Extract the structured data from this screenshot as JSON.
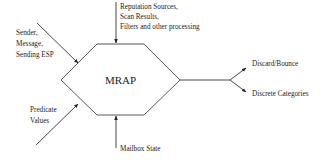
{
  "diagram": {
    "center": {
      "label": "MRAP",
      "shape": "hexagon"
    },
    "inputs": {
      "top": {
        "lines": [
          "Reputation Sources,",
          "Scan Results,",
          "Filters and other processing"
        ]
      },
      "upper_left": {
        "lines": [
          "Sender,",
          "Message,",
          "Sending ESP"
        ]
      },
      "lower_left": {
        "lines": [
          "Predicate",
          "Values"
        ]
      },
      "bottom": {
        "lines": [
          "Mailbox State"
        ]
      }
    },
    "outputs": [
      {
        "label": "Discard/Bounce"
      },
      {
        "label": "Discrete Categories"
      }
    ],
    "colors": {
      "line": "#333333",
      "text": "#222222",
      "background": "#ffffff"
    }
  }
}
